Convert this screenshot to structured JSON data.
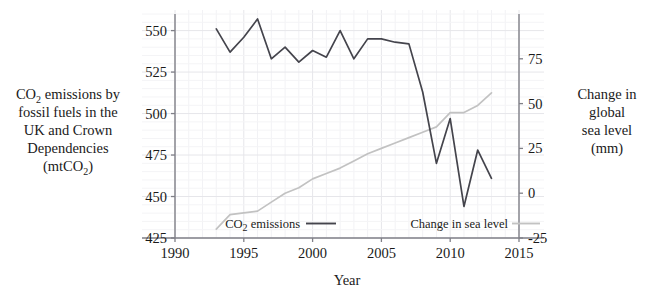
{
  "chart_data": {
    "type": "line",
    "title": "",
    "xlabel": "Year",
    "ylabel_left_lines": [
      "CO₂ emissions by",
      "fossil fuels in the",
      "UK and Crown",
      "Dependencies",
      "(mtCO₂)"
    ],
    "ylabel_right_lines": [
      "Change in",
      "global",
      "sea level",
      "(mm)"
    ],
    "x": [
      1993,
      1994,
      1995,
      1996,
      1997,
      1998,
      1999,
      2000,
      2001,
      2002,
      2003,
      2004,
      2005,
      2006,
      2007,
      2008,
      2009,
      2010,
      2011,
      2012,
      2013
    ],
    "xlim": [
      1990,
      2015
    ],
    "xticks": [
      1990,
      1995,
      2000,
      2005,
      2010,
      2015
    ],
    "xtick_labels": [
      "1990",
      "1995",
      "2000",
      "2005",
      "2010",
      "2015"
    ],
    "ylim_left": [
      425,
      560
    ],
    "yticks_left": [
      425,
      450,
      475,
      500,
      525,
      550
    ],
    "ytick_labels_left": [
      "425",
      "450",
      "475",
      "500",
      "525",
      "550"
    ],
    "ylim_right": [
      -25,
      100
    ],
    "yticks_right": [
      -25,
      0,
      25,
      50,
      75
    ],
    "ytick_labels_right": [
      "-25",
      "0",
      "25",
      "50",
      "75"
    ],
    "grid": true,
    "legend_position": "inside-bottom",
    "series": [
      {
        "name": "CO₂ emissions",
        "axis": "left",
        "color": "#44444c",
        "values": [
          551,
          537,
          546,
          557,
          533,
          540,
          531,
          538,
          534,
          550,
          533,
          545,
          545,
          543,
          542,
          513,
          470,
          497,
          444,
          478,
          461
        ]
      },
      {
        "name": "Change in sea level",
        "axis": "right",
        "color": "#c2c2c2",
        "values": [
          -20,
          -12,
          -11,
          -10,
          -5,
          0,
          3,
          8,
          11,
          14,
          18,
          22,
          25,
          28,
          31,
          34,
          37,
          45,
          45,
          49,
          56
        ]
      }
    ],
    "legend": [
      {
        "label": "CO₂ emissions",
        "color": "#44444c"
      },
      {
        "label": "Change in sea level",
        "color": "#c2c2c2"
      }
    ]
  }
}
